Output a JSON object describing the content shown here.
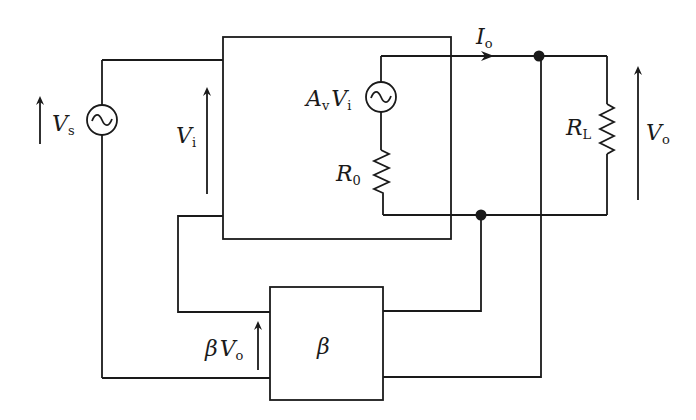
{
  "diagram": {
    "type": "feedback amplifier circuit (voltage-series feedback)",
    "blocks": {
      "amplifier": {
        "label": ""
      },
      "feedback": {
        "label": "β"
      }
    },
    "sources": {
      "input": {
        "symbol": "~",
        "label_main": "V",
        "label_sub": "s"
      },
      "dependent": {
        "symbol": "~",
        "label_main": "A",
        "label_sub1": "v",
        "label_main2": "V",
        "label_sub2": "i"
      }
    },
    "resistors": {
      "output_resistance": {
        "label_main": "R",
        "label_sub": "0"
      },
      "load": {
        "label_main": "R",
        "label_sub": "L"
      }
    },
    "labels": {
      "input_voltage": {
        "main": "V",
        "sub": "i"
      },
      "output_current": {
        "main": "I",
        "sub": "o"
      },
      "output_voltage": {
        "main": "V",
        "sub": "o"
      },
      "feedback_voltage": {
        "prefix": "β",
        "main": "V",
        "sub": "o"
      }
    },
    "colors": {
      "line": "#1a1a1a",
      "background": "#ffffff"
    }
  }
}
